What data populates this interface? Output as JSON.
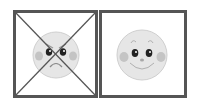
{
  "panels": [
    {
      "mood": "angry",
      "crossed_out": true,
      "icon": "angry-face-icon"
    },
    {
      "mood": "happy",
      "crossed_out": false,
      "icon": "happy-face-icon"
    }
  ],
  "colors": {
    "border": "#555555",
    "face": "#e6e6e6",
    "face_outline": "#cfcfcf",
    "cheek": "#c4c4c4",
    "eye": "#222222",
    "cross": "#555555"
  }
}
